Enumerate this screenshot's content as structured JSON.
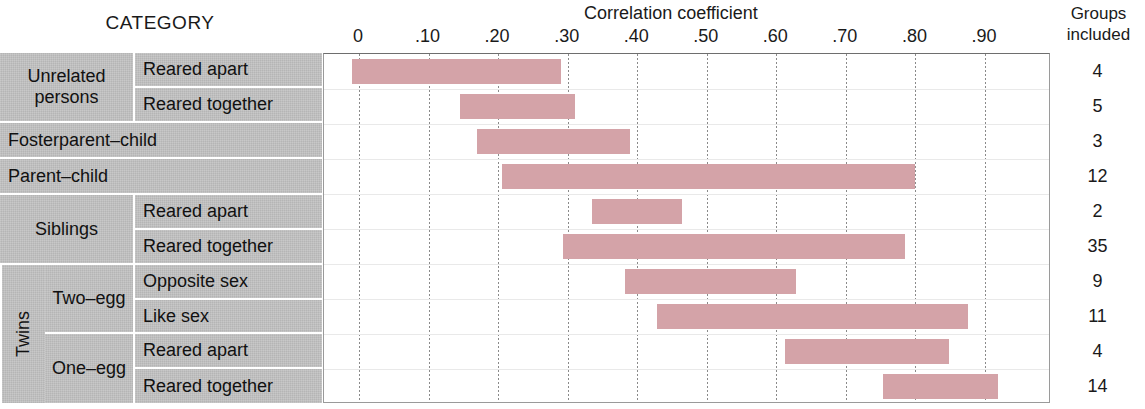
{
  "header": {
    "category_label": "CATEGORY",
    "axis_title": "Correlation coefficient",
    "groups_line1": "Groups",
    "groups_line2": "included"
  },
  "axis": {
    "ticks": [
      "0",
      ".10",
      ".20",
      ".30",
      ".40",
      ".50",
      ".60",
      ".70",
      ".80",
      ".90"
    ]
  },
  "categories": {
    "unrelated": "Unrelated\npersons",
    "unrelated_line1": "Unrelated",
    "unrelated_line2": "persons",
    "fosterparent": "Fosterparent–child",
    "parentchild": "Parent–child",
    "siblings": "Siblings",
    "twins": "Twins",
    "two_egg": "Two–egg",
    "one_egg": "One–egg",
    "reared_apart": "Reared apart",
    "reared_together": "Reared together",
    "opposite_sex": "Opposite sex",
    "like_sex": "Like sex"
  },
  "colors": {
    "bar": "#d4a3a8",
    "category_cell": "#b5b5b5",
    "gridline": "#8a8a8a",
    "plot_border": "#9a9a9a"
  },
  "chart_data": {
    "type": "bar",
    "orientation": "horizontal",
    "subtype": "range-bar",
    "title": "Correlation coefficient",
    "xlabel": "Correlation coefficient",
    "ylabel": "CATEGORY",
    "xlim": [
      0,
      1.0
    ],
    "xticks": [
      0,
      0.1,
      0.2,
      0.3,
      0.4,
      0.5,
      0.6,
      0.7,
      0.8,
      0.9
    ],
    "xticklabels": [
      "0",
      ".10",
      ".20",
      ".30",
      ".40",
      ".50",
      ".60",
      ".70",
      ".80",
      ".90"
    ],
    "grid": true,
    "legend": false,
    "extra_column": {
      "header": "Groups included",
      "values": [
        4,
        5,
        3,
        12,
        2,
        35,
        9,
        11,
        4,
        14
      ]
    },
    "rows": [
      {
        "group": "Unrelated persons",
        "subgroup": "Reared apart",
        "start": -0.01,
        "end": 0.29,
        "groups_included": 4
      },
      {
        "group": "Unrelated persons",
        "subgroup": "Reared together",
        "start": 0.145,
        "end": 0.31,
        "groups_included": 5
      },
      {
        "group": "Fosterparent–child",
        "subgroup": "",
        "start": 0.17,
        "end": 0.39,
        "groups_included": 3
      },
      {
        "group": "Parent–child",
        "subgroup": "",
        "start": 0.205,
        "end": 0.8,
        "groups_included": 12
      },
      {
        "group": "Siblings",
        "subgroup": "Reared apart",
        "start": 0.335,
        "end": 0.465,
        "groups_included": 2
      },
      {
        "group": "Siblings",
        "subgroup": "Reared together",
        "start": 0.293,
        "end": 0.785,
        "groups_included": 35
      },
      {
        "group": "Twins – Two–egg",
        "subgroup": "Opposite sex",
        "start": 0.382,
        "end": 0.628,
        "groups_included": 9
      },
      {
        "group": "Twins – Two–egg",
        "subgroup": "Like sex",
        "start": 0.428,
        "end": 0.876,
        "groups_included": 11
      },
      {
        "group": "Twins – One–egg",
        "subgroup": "Reared apart",
        "start": 0.612,
        "end": 0.848,
        "groups_included": 4
      },
      {
        "group": "Twins – One–egg",
        "subgroup": "Reared together",
        "start": 0.753,
        "end": 0.918,
        "groups_included": 14
      }
    ]
  }
}
